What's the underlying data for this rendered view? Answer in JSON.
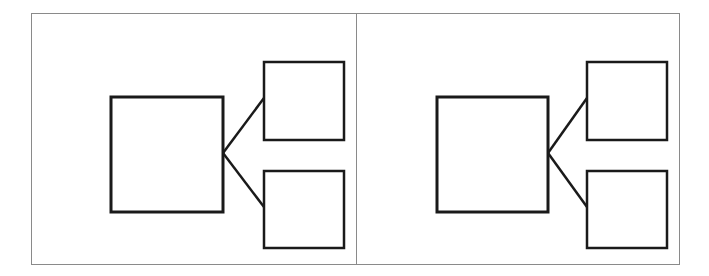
{
  "diagram": {
    "panels": [
      {
        "name": "left",
        "parent_box": {
          "x": 111,
          "y": 97,
          "w": 112,
          "h": 115
        },
        "child_boxes": [
          {
            "x": 264,
            "y": 62,
            "w": 80,
            "h": 78
          },
          {
            "x": 264,
            "y": 171,
            "w": 80,
            "h": 77
          }
        ],
        "connectors": [
          {
            "x1": 223,
            "y1": 153,
            "x2": 264,
            "y2": 98
          },
          {
            "x1": 223,
            "y1": 153,
            "x2": 264,
            "y2": 207
          }
        ]
      },
      {
        "name": "right",
        "parent_box": {
          "x": 437,
          "y": 97,
          "w": 111,
          "h": 115
        },
        "child_boxes": [
          {
            "x": 587,
            "y": 62,
            "w": 80,
            "h": 78
          },
          {
            "x": 587,
            "y": 171,
            "w": 80,
            "h": 77
          }
        ],
        "connectors": [
          {
            "x1": 548,
            "y1": 153,
            "x2": 587,
            "y2": 98
          },
          {
            "x1": 548,
            "y1": 153,
            "x2": 587,
            "y2": 207
          }
        ]
      }
    ],
    "colors": {
      "stroke": "#1a1a1a",
      "frame": "#8a8a8a",
      "background": "#ffffff"
    }
  }
}
